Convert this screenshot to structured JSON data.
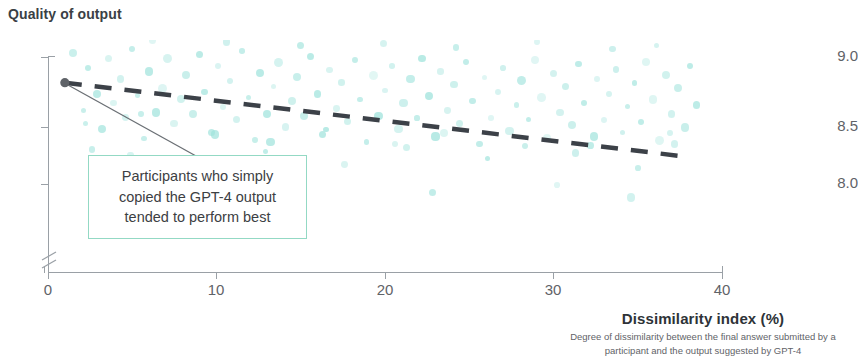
{
  "chart_title": "Quality of output",
  "axis": {
    "x_title": "Dissimilarity index (%)",
    "x_subtitle_line1": "Degree of dissimilarity between the final answer submitted by a",
    "x_subtitle_line2": "participant and the output suggested by GPT-4",
    "y_ticks": [
      "9.0",
      "8.5",
      "8.0"
    ],
    "x_ticks": [
      "0",
      "10",
      "20",
      "30",
      "40"
    ]
  },
  "annotation": {
    "line1": "Participants who simply",
    "line2": "copied the GPT-4 output",
    "line3": "tended to perform best"
  },
  "colors": {
    "scatter": "#9fe3dc",
    "trendline": "#3c4148",
    "callout_border": "#93d9c4",
    "axis": "#9aa0a6",
    "text": "#3c4043",
    "highlight_point": "#5f6368"
  },
  "chart_data": {
    "type": "scatter",
    "title": "Quality of output",
    "xlabel": "Dissimilarity index (%)",
    "ylabel": "Quality of output",
    "xlim": [
      0,
      40
    ],
    "ylim": [
      7.75,
      9.0
    ],
    "grid": false,
    "legend": "none",
    "y_axis_break": true,
    "trendline": {
      "type": "linear-dashed",
      "x_start": 1.0,
      "y_start": 8.77,
      "x_end": 38.0,
      "y_end": 8.37,
      "slope_per_unit": -0.0108
    },
    "highlight_point": {
      "x": 1.0,
      "y": 8.77
    },
    "annotation_text": "Participants who simply copied the GPT-4 output tended to perform best",
    "points": [
      [
        1.0,
        8.77
      ],
      [
        1.5,
        8.93
      ],
      [
        2.1,
        8.62
      ],
      [
        2.4,
        8.85
      ],
      [
        2.9,
        8.71
      ],
      [
        3.2,
        8.52
      ],
      [
        3.6,
        8.9
      ],
      [
        3.9,
        8.66
      ],
      [
        4.3,
        8.79
      ],
      [
        4.6,
        8.58
      ],
      [
        5.0,
        8.95
      ],
      [
        5.3,
        8.7
      ],
      [
        5.7,
        8.47
      ],
      [
        6.0,
        8.83
      ],
      [
        6.4,
        8.61
      ],
      [
        6.8,
        8.74
      ],
      [
        7.1,
        8.9
      ],
      [
        7.5,
        8.55
      ],
      [
        7.9,
        8.68
      ],
      [
        8.2,
        8.81
      ],
      [
        8.6,
        8.6
      ],
      [
        9.0,
        8.92
      ],
      [
        9.3,
        8.72
      ],
      [
        9.7,
        8.5
      ],
      [
        10.1,
        8.86
      ],
      [
        10.4,
        8.64
      ],
      [
        10.8,
        8.78
      ],
      [
        11.2,
        8.57
      ],
      [
        11.5,
        8.94
      ],
      [
        11.9,
        8.69
      ],
      [
        12.3,
        8.46
      ],
      [
        12.6,
        8.82
      ],
      [
        13.0,
        8.6
      ],
      [
        13.4,
        8.75
      ],
      [
        13.7,
        8.88
      ],
      [
        14.1,
        8.53
      ],
      [
        14.5,
        8.67
      ],
      [
        14.8,
        8.8
      ],
      [
        15.2,
        8.59
      ],
      [
        15.6,
        8.91
      ],
      [
        16.0,
        8.71
      ],
      [
        16.3,
        8.49
      ],
      [
        16.7,
        8.84
      ],
      [
        17.1,
        8.63
      ],
      [
        17.4,
        8.77
      ],
      [
        17.8,
        8.56
      ],
      [
        18.2,
        8.89
      ],
      [
        18.5,
        8.68
      ],
      [
        18.9,
        8.45
      ],
      [
        19.3,
        8.81
      ],
      [
        19.6,
        8.59
      ],
      [
        20.0,
        8.73
      ],
      [
        20.4,
        8.86
      ],
      [
        20.8,
        8.52
      ],
      [
        21.1,
        8.66
      ],
      [
        21.5,
        8.79
      ],
      [
        21.9,
        8.58
      ],
      [
        22.2,
        8.9
      ],
      [
        22.6,
        8.7
      ],
      [
        23.0,
        8.48
      ],
      [
        23.3,
        8.83
      ],
      [
        23.7,
        8.62
      ],
      [
        24.1,
        8.76
      ],
      [
        24.4,
        8.55
      ],
      [
        24.8,
        8.88
      ],
      [
        25.2,
        8.67
      ],
      [
        25.6,
        8.44
      ],
      [
        25.9,
        8.8
      ],
      [
        26.3,
        8.58
      ],
      [
        26.7,
        8.72
      ],
      [
        27.0,
        8.85
      ],
      [
        27.4,
        8.51
      ],
      [
        27.8,
        8.65
      ],
      [
        28.1,
        8.78
      ],
      [
        28.5,
        8.57
      ],
      [
        28.9,
        8.89
      ],
      [
        29.3,
        8.69
      ],
      [
        29.6,
        8.47
      ],
      [
        30.0,
        8.82
      ],
      [
        30.4,
        8.61
      ],
      [
        30.7,
        8.75
      ],
      [
        31.1,
        8.54
      ],
      [
        31.5,
        8.87
      ],
      [
        31.8,
        8.66
      ],
      [
        32.2,
        8.43
      ],
      [
        32.6,
        8.79
      ],
      [
        33.0,
        8.57
      ],
      [
        33.3,
        8.71
      ],
      [
        33.7,
        8.84
      ],
      [
        34.1,
        8.5
      ],
      [
        34.4,
        8.64
      ],
      [
        34.8,
        8.77
      ],
      [
        35.2,
        8.56
      ],
      [
        35.5,
        8.88
      ],
      [
        35.9,
        8.68
      ],
      [
        36.3,
        8.46
      ],
      [
        36.7,
        8.81
      ],
      [
        37.0,
        8.6
      ],
      [
        37.4,
        8.74
      ],
      [
        37.8,
        8.53
      ],
      [
        38.1,
        8.86
      ],
      [
        38.5,
        8.65
      ],
      [
        2.6,
        8.41
      ],
      [
        4.9,
        8.38
      ],
      [
        8.4,
        8.35
      ],
      [
        12.9,
        8.4
      ],
      [
        17.6,
        8.33
      ],
      [
        21.3,
        8.42
      ],
      [
        26.1,
        8.36
      ],
      [
        31.3,
        8.39
      ],
      [
        35.0,
        8.31
      ],
      [
        37.2,
        8.44
      ],
      [
        6.2,
        9.0
      ],
      [
        10.6,
        8.99
      ],
      [
        15.0,
        8.97
      ],
      [
        19.9,
        8.98
      ],
      [
        24.2,
        8.96
      ],
      [
        29.0,
        8.99
      ],
      [
        33.5,
        8.95
      ],
      [
        36.1,
        8.97
      ],
      [
        2.2,
        8.55
      ],
      [
        5.5,
        8.6
      ],
      [
        9.9,
        8.49
      ],
      [
        13.2,
        8.45
      ],
      [
        16.5,
        8.52
      ],
      [
        20.6,
        8.44
      ],
      [
        23.5,
        8.5
      ],
      [
        28.3,
        8.43
      ],
      [
        32.4,
        8.48
      ],
      [
        36.9,
        8.5
      ],
      [
        7.7,
        8.2
      ],
      [
        14.3,
        8.25
      ],
      [
        22.8,
        8.18
      ],
      [
        30.2,
        8.22
      ],
      [
        34.6,
        8.15
      ]
    ]
  }
}
